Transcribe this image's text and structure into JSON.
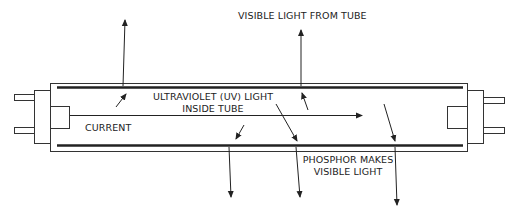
{
  "diagram": {
    "labels": {
      "visible_light_from_tube": "VISIBLE LIGHT FROM TUBE",
      "uv_light_line1": "ULTRAVIOLET (UV) LIGHT",
      "uv_light_line2": "INSIDE TUBE",
      "current": "CURRENT",
      "phosphor_line1": "PHOSPHOR MAKES",
      "phosphor_line2": "VISIBLE LIGHT"
    },
    "colors": {
      "line": "#222222",
      "background": "#ffffff"
    }
  }
}
